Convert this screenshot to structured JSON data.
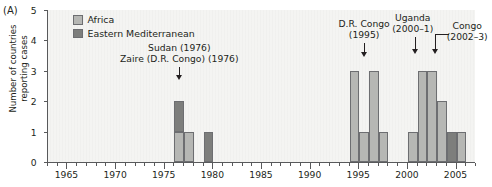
{
  "panel": {
    "label": "(A)"
  },
  "axes": {
    "ylabel_line1": "Number of countries",
    "ylabel_line2": "reporting cases",
    "yticks": [
      0,
      1,
      2,
      3,
      4,
      5
    ],
    "xticks_major": [
      1965,
      1970,
      1975,
      1980,
      1985,
      1990,
      1995,
      2000,
      2005
    ],
    "xmin": 1963,
    "xmax": 2007,
    "ymin": 0,
    "ymax": 5
  },
  "legend": {
    "items": [
      {
        "label": "Africa",
        "color": "#b6b7b4",
        "key": "africa"
      },
      {
        "label": "Eastern Mediterranean",
        "color": "#7d7e7c",
        "key": "emed"
      }
    ]
  },
  "annotations": [
    {
      "name": "sudan-zaire-1976",
      "line1": "Sudan (1976)",
      "line2": "Zaire (D.R. Congo) (1976)",
      "target_year": 1976
    },
    {
      "name": "dr-congo-1995",
      "line1": "D.R. Congo",
      "line2": "(1995)",
      "target_year": 1995
    },
    {
      "name": "uganda-2000-1",
      "line1": "Uganda",
      "line2": "(2000–1)",
      "target_year": 2000
    },
    {
      "name": "congo-2002-3",
      "line1": "Congo",
      "line2": "(2002–3)",
      "target_year": 2002
    }
  ],
  "chart_data": {
    "type": "bar",
    "title": "",
    "subtitle": "",
    "xlabel": "",
    "ylabel": "Number of countries reporting cases",
    "xlim": [
      1963,
      2007
    ],
    "ylim": [
      0,
      5
    ],
    "grid": false,
    "legend_position": "top-left-inside",
    "stacked": true,
    "bar_width_years": 1,
    "categories": [
      1976,
      1977,
      1979,
      1994,
      1995,
      1996,
      1997,
      2000,
      2001,
      2002,
      2003,
      2004,
      2005
    ],
    "series": [
      {
        "name": "Africa",
        "color": "#b6b7b4",
        "values": [
          1,
          1,
          0,
          3,
          1,
          3,
          1,
          1,
          3,
          3,
          2,
          0,
          1
        ]
      },
      {
        "name": "Eastern Mediterranean",
        "color": "#7d7e7c",
        "values": [
          1,
          0,
          1,
          0,
          0,
          0,
          0,
          0,
          0,
          0,
          0,
          1,
          0
        ]
      }
    ],
    "totals": [
      2,
      1,
      1,
      3,
      1,
      3,
      1,
      1,
      3,
      3,
      2,
      1,
      1
    ]
  }
}
